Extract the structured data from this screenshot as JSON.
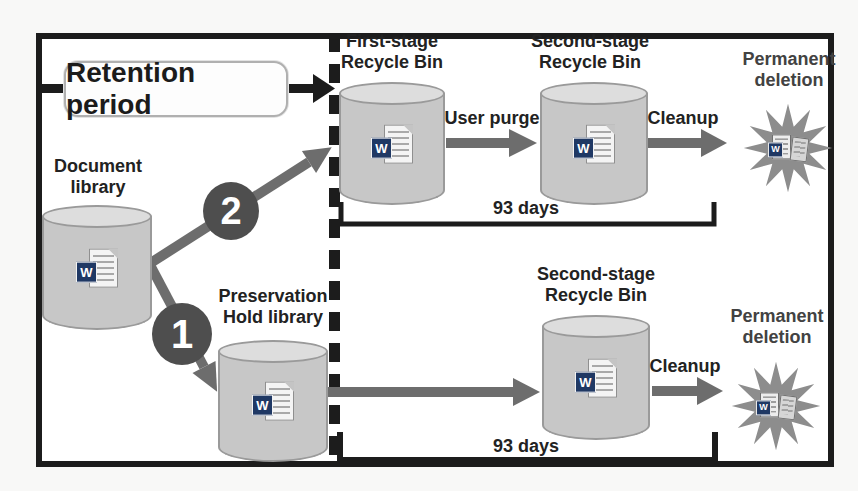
{
  "figure": {
    "retention_box": {
      "label": "Retention period"
    },
    "nodes": {
      "document_library": "Document library",
      "first_stage_recycle_bin": "First-stage Recycle Bin",
      "second_stage_recycle_bin_top": "Second-stage Recycle Bin",
      "preservation_hold_library": "Preservation Hold library",
      "second_stage_recycle_bin_bottom": "Second-stage Recycle Bin",
      "permanent_deletion_top": "Permanent deletion",
      "permanent_deletion_bottom": "Permanent deletion"
    },
    "edge_labels": {
      "user_purge": "User purge",
      "cleanup_top": "Cleanup",
      "cleanup_bottom": "Cleanup"
    },
    "durations": {
      "top_row": "93 days",
      "bottom_row": "93 days"
    },
    "badges": [
      {
        "number": "2"
      },
      {
        "number": "1"
      }
    ],
    "word_icon_letter": "W",
    "colors": {
      "border_black": "#1c1c1c",
      "cylinder_fill": "#c7c7c7",
      "cylinder_top_fill": "#dddddd",
      "cylinder_stroke": "#9a9a9a",
      "arrow_gray": "#6d6d6d",
      "badge_fill": "#4e4e4e",
      "starburst_fill": "#8d8d8d",
      "word_blue": "#1f3864",
      "text_dark": "#222222"
    }
  }
}
